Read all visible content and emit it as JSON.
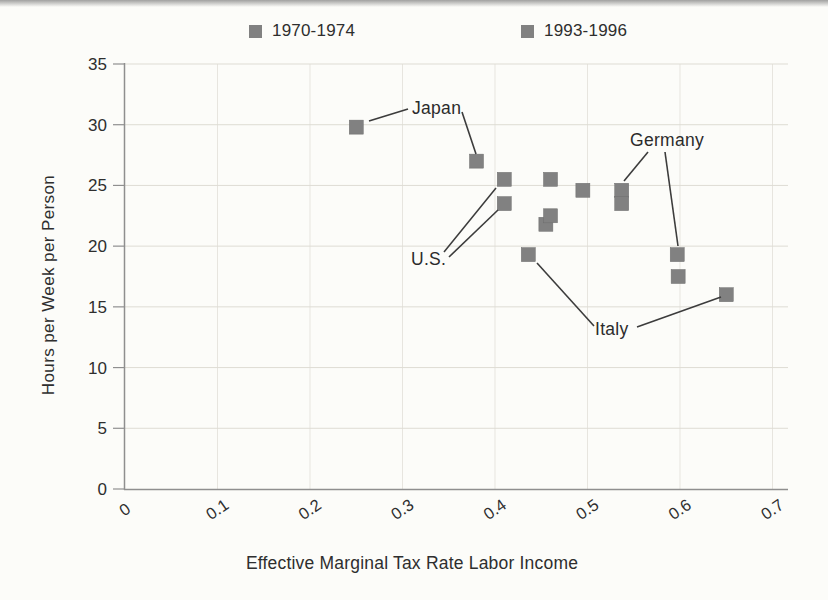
{
  "chart_data": {
    "type": "scatter",
    "xlabel": "Effective Marginal Tax Rate Labor Income",
    "ylabel": "Hours per Week per Person",
    "xlim": [
      0,
      0.7
    ],
    "ylim": [
      0,
      35
    ],
    "xticks": [
      "0",
      "0.1",
      "0.2",
      "0.3",
      "0.4",
      "0.5",
      "0.6",
      "0.7"
    ],
    "yticks": [
      "0",
      "5",
      "10",
      "15",
      "20",
      "25",
      "30",
      "35"
    ],
    "grid": true,
    "legend_position": "top",
    "marker_shape": "square",
    "colors": {
      "marker": "#818181",
      "grid_horizontal": "#dedcd4",
      "grid_vertical": "#e7e5df",
      "axis": "#8f8f8f",
      "text": "#2e2e2e",
      "annotation_line": "#3c3c3c"
    },
    "series": [
      {
        "name": "1970-1974",
        "points": [
          {
            "x": 0.25,
            "y": 29.8,
            "country": "Japan"
          },
          {
            "x": 0.41,
            "y": 23.5,
            "country": "U.S."
          },
          {
            "x": 0.46,
            "y": 25.5
          },
          {
            "x": 0.455,
            "y": 21.8
          },
          {
            "x": 0.495,
            "y": 24.6
          },
          {
            "x": 0.537,
            "y": 24.6,
            "country": "Germany"
          },
          {
            "x": 0.436,
            "y": 19.3,
            "country": "Italy"
          }
        ]
      },
      {
        "name": "1993-1996",
        "points": [
          {
            "x": 0.38,
            "y": 27.0,
            "country": "Japan"
          },
          {
            "x": 0.41,
            "y": 25.5,
            "country": "U.S."
          },
          {
            "x": 0.46,
            "y": 22.5
          },
          {
            "x": 0.537,
            "y": 23.5
          },
          {
            "x": 0.597,
            "y": 19.3,
            "country": "Germany"
          },
          {
            "x": 0.598,
            "y": 17.5
          },
          {
            "x": 0.65,
            "y": 16.0,
            "country": "Italy"
          }
        ]
      }
    ],
    "annotations": [
      {
        "label": "Japan",
        "text_x": 412,
        "text_y": 108,
        "lines": [
          [
            408,
            109,
            369,
            121
          ],
          [
            462,
            112,
            476,
            154
          ]
        ]
      },
      {
        "label": "Germany",
        "text_x": 630,
        "text_y": 140,
        "lines": [
          [
            648,
            152,
            624,
            181
          ],
          [
            665,
            152,
            678,
            246
          ]
        ]
      },
      {
        "label": "U.S.",
        "text_x": 411,
        "text_y": 259,
        "lines": [
          [
            444,
            252,
            496,
            188
          ],
          [
            449,
            257,
            498,
            210
          ]
        ]
      },
      {
        "label": "Italy",
        "text_x": 595,
        "text_y": 329,
        "lines": [
          [
            537,
            263,
            594,
            326
          ],
          [
            637,
            327,
            721,
            297
          ]
        ]
      }
    ]
  }
}
